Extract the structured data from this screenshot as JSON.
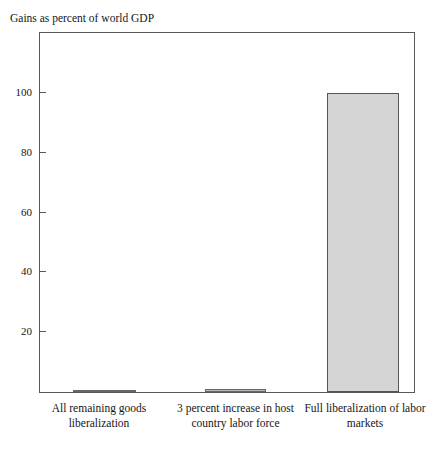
{
  "chart_data": {
    "type": "bar",
    "title": "Gains as percent of world GDP",
    "xlabel": "",
    "ylabel": "Gains as percent of world GDP",
    "ylim": [
      0,
      120
    ],
    "yticks": [
      20,
      40,
      60,
      80,
      100
    ],
    "ytick_labels": [
      "20",
      "40",
      "60",
      "80",
      "100"
    ],
    "grid": false,
    "legend": "none",
    "categories": [
      "All remaining goods liberalization",
      "3 percent increase in host country labor force",
      "Full liberalization of labor markets"
    ],
    "category_lines": [
      [
        "All remaining goods",
        "liberalization"
      ],
      [
        "3 percent increase in host",
        "country labor force"
      ],
      [
        "Full liberalization of labor",
        "markets"
      ]
    ],
    "values": [
      0.3,
      1.0,
      100.0
    ],
    "bar_color": "#d5d5d5",
    "bar_edge_color": "#555555",
    "frame_color": "#585858",
    "background_color": "#ffffff"
  },
  "axis": {
    "tick_0": "20",
    "tick_1": "40",
    "tick_2": "60",
    "tick_3": "80",
    "tick_4": "100"
  },
  "labels": {
    "cat0_line0": "All remaining goods",
    "cat0_line1": "liberalization",
    "cat1_line0": "3 percent increase in host",
    "cat1_line1": "country labor force",
    "cat2_line0": "Full liberalization of labor",
    "cat2_line1": "markets"
  }
}
